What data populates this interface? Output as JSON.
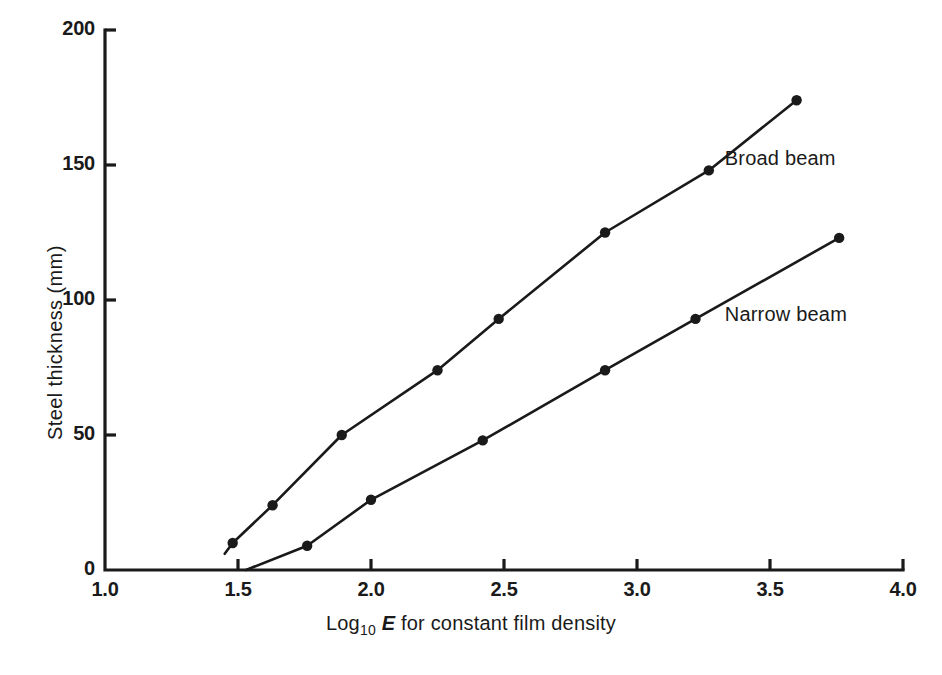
{
  "chart_data": {
    "type": "line",
    "title": "",
    "subtitle": "",
    "xlabel_parts": {
      "prefix": "Log",
      "subscript": "10",
      "italic": "E",
      "suffix": " for constant film density"
    },
    "xlabel": "Log10 E for constant film density",
    "ylabel": "Steel thickness (mm)",
    "xlim": [
      1.0,
      4.0
    ],
    "ylim": [
      0,
      200
    ],
    "grid": false,
    "legend_position": "inline-annotation",
    "xticks": [
      "1.0",
      "1.5",
      "2.0",
      "2.5",
      "3.0",
      "3.5",
      "4.0"
    ],
    "xtick_values": [
      1.0,
      1.5,
      2.0,
      2.5,
      3.0,
      3.5,
      4.0
    ],
    "yticks": [
      "0",
      "50",
      "100",
      "150",
      "200"
    ],
    "ytick_values": [
      0,
      50,
      100,
      150,
      200
    ],
    "series": [
      {
        "name": "Broad beam",
        "label_x": 3.33,
        "label_y": 152,
        "marker": "filled-circle",
        "color": "#1a1a1a",
        "points": [
          {
            "x": 1.48,
            "y": 10
          },
          {
            "x": 1.63,
            "y": 24
          },
          {
            "x": 1.89,
            "y": 50
          },
          {
            "x": 2.25,
            "y": 74
          },
          {
            "x": 2.48,
            "y": 93
          },
          {
            "x": 2.88,
            "y": 125
          },
          {
            "x": 3.27,
            "y": 148
          },
          {
            "x": 3.6,
            "y": 174
          }
        ],
        "line_start": {
          "x": 1.45,
          "y": 6
        },
        "line_end": {
          "x": 3.61,
          "y": 175
        }
      },
      {
        "name": "Narrow beam",
        "label_x": 3.33,
        "label_y": 94,
        "marker": "filled-circle",
        "color": "#1a1a1a",
        "points": [
          {
            "x": 1.76,
            "y": 9
          },
          {
            "x": 2.0,
            "y": 26
          },
          {
            "x": 2.42,
            "y": 48
          },
          {
            "x": 2.88,
            "y": 74
          },
          {
            "x": 3.22,
            "y": 93
          },
          {
            "x": 3.76,
            "y": 123
          }
        ],
        "line_start": {
          "x": 1.53,
          "y": 0
        },
        "line_end": {
          "x": 3.77,
          "y": 124
        }
      }
    ]
  },
  "axes": {
    "y_title": "Steel thickness (mm)",
    "x_title_prefix": "Log",
    "x_title_sub": "10",
    "x_title_italic": "E",
    "x_title_suffix": " for constant film density"
  },
  "annotations": {
    "broad_beam": "Broad beam",
    "narrow_beam": "Narrow beam"
  }
}
